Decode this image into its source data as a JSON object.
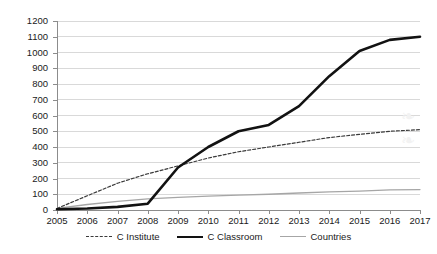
{
  "chart_data": {
    "type": "line",
    "title": "",
    "xlabel": "",
    "ylabel": "",
    "categories": [
      "2005",
      "2006",
      "2007",
      "2008",
      "2009",
      "2010",
      "2011",
      "2012",
      "2013",
      "2014",
      "2015",
      "2016",
      "2017"
    ],
    "ylim": [
      0,
      1200
    ],
    "ytick_values": [
      0,
      100,
      200,
      300,
      400,
      500,
      600,
      700,
      800,
      900,
      1000,
      1100,
      1200
    ],
    "ytick_labels": [
      "0",
      "100",
      "200",
      "300",
      "400",
      "500",
      "600",
      "700",
      "800",
      "900",
      "1000",
      "1100",
      "1200"
    ],
    "grid": true,
    "legend_position": "bottom",
    "series": [
      {
        "name": "C Institute",
        "style": "dashed",
        "color": "#3a3a3a",
        "values": [
          10,
          90,
          170,
          230,
          280,
          330,
          370,
          400,
          430,
          460,
          480,
          500,
          510
        ]
      },
      {
        "name": "C Classroom",
        "style": "solid-bold",
        "color": "#121212",
        "values": [
          5,
          10,
          20,
          40,
          270,
          400,
          500,
          540,
          660,
          850,
          1010,
          1080,
          1100
        ]
      },
      {
        "name": "Countries",
        "style": "solid-thin",
        "color": "#a6a6a6",
        "values": [
          10,
          35,
          55,
          70,
          80,
          88,
          95,
          100,
          108,
          115,
          120,
          128,
          130
        ]
      }
    ]
  },
  "legend": {
    "items": [
      {
        "label": "C Institute"
      },
      {
        "label": "C Classroom"
      },
      {
        "label": "Countries"
      }
    ]
  },
  "watermark": {
    "text": "❧"
  }
}
